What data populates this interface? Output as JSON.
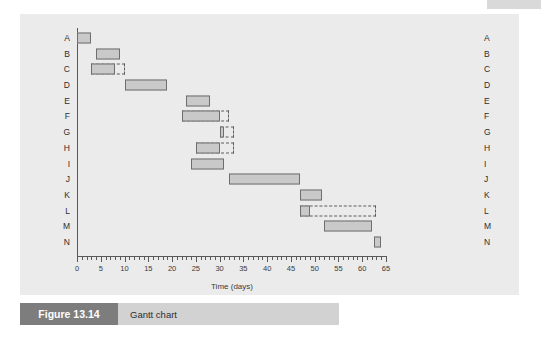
{
  "figure": {
    "number_label": "Figure 13.14",
    "caption": "Gantt chart"
  },
  "chart_data": {
    "type": "bar",
    "orientation": "horizontal",
    "title": "Gantt chart",
    "xlabel": "Time (days)",
    "ylabel": "",
    "xlim": [
      0,
      65
    ],
    "x_major_step": 5,
    "x_minor_step": 1,
    "grid": false,
    "legend": null,
    "x_tick_labels": [
      "0",
      "5",
      "10",
      "15",
      "20",
      "25",
      "30",
      "35",
      "40",
      "45",
      "50",
      "55",
      "60",
      "65"
    ],
    "x_tick_values": [
      0,
      5,
      10,
      15,
      20,
      25,
      30,
      35,
      40,
      45,
      50,
      55,
      60,
      65
    ],
    "categories": [
      "A",
      "B",
      "C",
      "D",
      "E",
      "F",
      "G",
      "H",
      "I",
      "J",
      "K",
      "L",
      "M",
      "N"
    ],
    "tasks": [
      {
        "label": "A",
        "start": 0,
        "end": 3,
        "float_end": null
      },
      {
        "label": "B",
        "start": 4,
        "end": 9,
        "float_end": null
      },
      {
        "label": "C",
        "start": 3,
        "end": 8,
        "float_end": 10
      },
      {
        "label": "D",
        "start": 10,
        "end": 19,
        "float_end": null
      },
      {
        "label": "E",
        "start": 23,
        "end": 28,
        "float_end": null
      },
      {
        "label": "F",
        "start": 22,
        "end": 30,
        "float_end": 32
      },
      {
        "label": "G",
        "start": 30,
        "end": 31,
        "float_end": 33
      },
      {
        "label": "H",
        "start": 25,
        "end": 30,
        "float_end": 33
      },
      {
        "label": "I",
        "start": 24,
        "end": 31,
        "float_end": null
      },
      {
        "label": "J",
        "start": 32,
        "end": 47,
        "float_end": null
      },
      {
        "label": "K",
        "start": 47,
        "end": 51.5,
        "float_end": null
      },
      {
        "label": "L",
        "start": 47,
        "end": 49,
        "float_end": 63
      },
      {
        "label": "M",
        "start": 52,
        "end": 62,
        "float_end": null
      },
      {
        "label": "N",
        "start": 62.5,
        "end": 64,
        "float_end": null
      }
    ],
    "colors": {
      "bar_fill": "#c9c9c9",
      "bar_stroke": "#6e6e6e",
      "float_stroke": "#5c5c5c",
      "panel_background": "#ebebeb",
      "axis": "#595959",
      "caption_bar": "#d2d2d2",
      "caption_number_bg": "#7d7d7d"
    }
  }
}
